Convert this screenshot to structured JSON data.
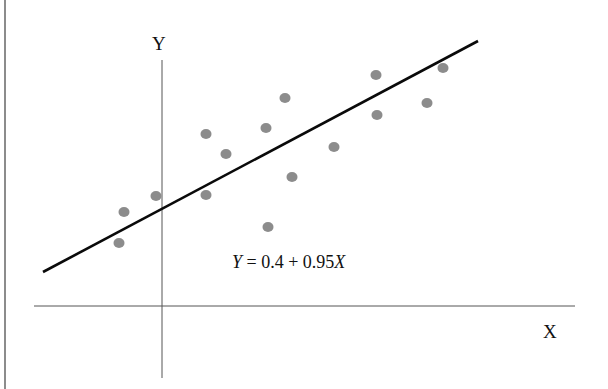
{
  "chart_data": {
    "type": "scatter",
    "title": "",
    "xlabel": "X",
    "ylabel": "Y",
    "grid": false,
    "legend": null,
    "annotations": [
      "Y = 0.4 + 0.95X"
    ],
    "regression_line": {
      "intercept": 0.4,
      "slope": 0.95,
      "equation": "Y = 0.4 + 0.95X"
    },
    "points_px": [
      [
        119,
        243
      ],
      [
        124,
        212
      ],
      [
        156,
        196
      ],
      [
        206,
        134
      ],
      [
        206,
        195
      ],
      [
        226,
        154
      ],
      [
        266,
        128
      ],
      [
        268,
        227
      ],
      [
        285,
        98
      ],
      [
        292,
        177
      ],
      [
        334,
        147
      ],
      [
        376,
        75
      ],
      [
        377,
        115
      ],
      [
        427,
        103
      ],
      [
        443,
        68
      ]
    ],
    "line_px": {
      "x1": 43,
      "y1": 272,
      "x2": 478,
      "y2": 41
    },
    "axes_px": {
      "x_axis": {
        "y": 306,
        "x1": 34,
        "x2": 575
      },
      "y_axis": {
        "x": 162,
        "y1": 60,
        "y2": 378
      }
    },
    "colors": {
      "points": "#8c8c8c",
      "line": "#0a0a0a",
      "axes": "#555555",
      "border": "#666666"
    }
  },
  "labels": {
    "x_axis": "X",
    "y_axis": "Y",
    "equation_y": "Y",
    "equation_body": " = 0.4 + 0.95",
    "equation_x": "X"
  }
}
